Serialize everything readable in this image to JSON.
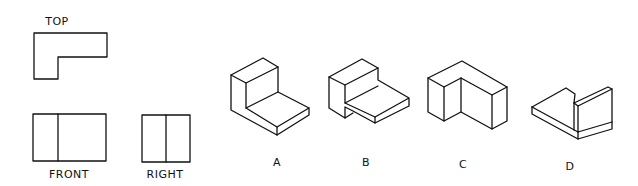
{
  "views": {
    "top_label": "TOP",
    "front_label": "FRONT",
    "right_label": "RIGHT"
  },
  "options": [
    {
      "label": "A"
    },
    {
      "label": "B"
    },
    {
      "label": "C"
    },
    {
      "label": "D"
    }
  ]
}
